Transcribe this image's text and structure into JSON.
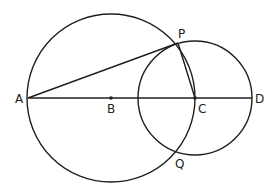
{
  "diagram": {
    "title": "",
    "points": {
      "A": {
        "label": "A",
        "x": 28,
        "y": 98
      },
      "B": {
        "label": "B",
        "x": 111,
        "y": 98
      },
      "C": {
        "label": "C",
        "x": 195,
        "y": 98
      },
      "D": {
        "label": "D",
        "x": 252,
        "y": 98
      },
      "P": {
        "label": "P",
        "x": 178,
        "y": 43
      },
      "Q": {
        "label": "Q",
        "x": 178,
        "y": 155
      }
    },
    "circles": [
      {
        "name": "large-circle",
        "center": "B",
        "radius": 84
      },
      {
        "name": "small-circle",
        "center": "C",
        "radius": 57
      }
    ],
    "segments": [
      {
        "name": "segment-AD",
        "from": "A",
        "to": "D"
      },
      {
        "name": "segment-AP",
        "from": "A",
        "to": "P"
      },
      {
        "name": "segment-PC",
        "from": "P",
        "to": "C"
      }
    ],
    "marked_points": [
      "B",
      "C"
    ],
    "colors": {
      "stroke": "#1f1f1f",
      "label": "#222222",
      "background": "#ffffff"
    }
  }
}
